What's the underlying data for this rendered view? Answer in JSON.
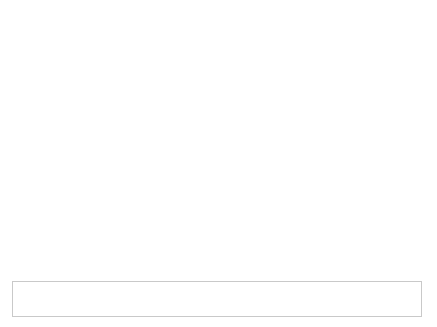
{
  "chart_data": {
    "type": "area",
    "xlabel": "Year",
    "ylabel": "Tons",
    "categories": [
      "1960",
      "1970",
      "1980",
      "1990",
      "2000",
      "2005",
      "2010",
      "2015",
      "2017",
      "2018"
    ],
    "ylim": [
      0,
      40000000
    ],
    "yticks": [
      0,
      10000000,
      20000000,
      30000000,
      40000000
    ],
    "ytick_labels": [
      "0",
      "10 000 000",
      "20 000 000",
      "30 000 000",
      "40 000 000"
    ],
    "grid": true,
    "stacked": true,
    "legend_position": "bottom",
    "series": [
      {
        "name": "Landfilled",
        "color": "#d7d7d7",
        "values": [
          390000,
          2770000,
          6670000,
          16200000,
          22100000,
          23800000,
          24300000,
          25800000,
          26300000,
          27000000
        ]
      },
      {
        "name": "Combustion with energy recovery",
        "color": "#2f9be0",
        "values": [
          0,
          0,
          10000,
          1600000,
          3600000,
          4750000,
          5030000,
          5330000,
          5590000,
          5620000
        ]
      },
      {
        "name": "Composted",
        "color": "#f5c030",
        "values": [
          0,
          0,
          0,
          0,
          0,
          0,
          0,
          0,
          0,
          0
        ]
      },
      {
        "name": "Recycled",
        "color": "#17315e",
        "values": [
          0,
          0,
          20000,
          370000,
          1480000,
          1780000,
          2500000,
          3120000,
          3000000,
          3090000
        ]
      }
    ],
    "totals": [
      390000,
      2770000,
      6700000,
      18170000,
      27180000,
      30330000,
      31830000,
      34250000,
      34890000,
      35710000
    ]
  },
  "legend": {
    "hint": "Click on legend items below to customize items displayed in the chart",
    "items": [
      {
        "label": "Recycled",
        "color": "#17315e"
      },
      {
        "label": "Composted",
        "color": "#f5c030"
      },
      {
        "label": "Combustion with energy recovery",
        "color": "#2f9be0"
      },
      {
        "label": "Landfilled",
        "color": "#d7d7d7"
      }
    ]
  }
}
